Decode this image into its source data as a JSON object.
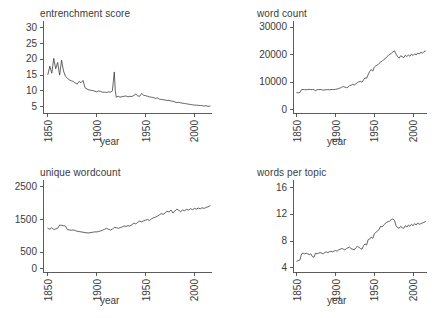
{
  "figure": {
    "background": "#ffffff",
    "ink": "#3c3c3c",
    "layout": "2x2 grid of line charts"
  },
  "chart_data": [
    {
      "id": "entrenchment-score",
      "type": "line",
      "title": "entrenchment score",
      "xlabel": "year",
      "ylabel": "",
      "xlim": [
        1845,
        2018
      ],
      "ylim": [
        3.0,
        31.5
      ],
      "xticks": [
        1850,
        1900,
        1950,
        2000
      ],
      "yticks": [
        5,
        10,
        15,
        20,
        25,
        30
      ],
      "grid": false,
      "legend": "none",
      "x": [
        1850,
        1852,
        1854,
        1856,
        1858,
        1860,
        1862,
        1864,
        1866,
        1868,
        1870,
        1872,
        1874,
        1876,
        1878,
        1880,
        1882,
        1884,
        1886,
        1888,
        1890,
        1892,
        1894,
        1896,
        1898,
        1900,
        1902,
        1904,
        1906,
        1908,
        1910,
        1912,
        1914,
        1916,
        1917,
        1918,
        1919,
        1920,
        1922,
        1924,
        1926,
        1928,
        1930,
        1932,
        1934,
        1936,
        1938,
        1940,
        1942,
        1944,
        1946,
        1948,
        1950,
        1952,
        1954,
        1956,
        1958,
        1960,
        1962,
        1964,
        1966,
        1968,
        1970,
        1972,
        1974,
        1976,
        1978,
        1980,
        1982,
        1984,
        1986,
        1988,
        1990,
        1992,
        1994,
        1996,
        1998,
        2000,
        2002,
        2004,
        2006,
        2008,
        2010,
        2012,
        2014,
        2016
      ],
      "values": [
        15.2,
        17.8,
        15.6,
        20.3,
        17.0,
        19.0,
        15.0,
        19.7,
        16.3,
        14.6,
        14.0,
        13.5,
        13.2,
        13.0,
        12.5,
        12.2,
        13.0,
        12.6,
        13.3,
        11.0,
        10.6,
        10.3,
        10.2,
        10.1,
        9.9,
        9.7,
        10.0,
        9.8,
        9.6,
        9.6,
        9.5,
        9.7,
        9.6,
        10.0,
        13.0,
        16.0,
        10.0,
        8.0,
        8.3,
        8.0,
        8.2,
        8.3,
        8.4,
        8.1,
        8.3,
        8.2,
        8.6,
        9.0,
        8.4,
        8.3,
        9.2,
        8.6,
        8.5,
        8.3,
        8.1,
        8.0,
        7.9,
        7.6,
        7.8,
        7.4,
        7.3,
        7.2,
        7.1,
        7.0,
        7.0,
        6.8,
        6.7,
        6.5,
        6.3,
        6.4,
        6.2,
        6.1,
        6.0,
        5.9,
        5.8,
        5.7,
        5.6,
        5.5,
        5.5,
        5.4,
        5.4,
        5.3,
        5.2,
        5.3,
        5.1,
        5.2
      ]
    },
    {
      "id": "word-count",
      "type": "line",
      "title": "word count",
      "xlabel": "year",
      "ylabel": "",
      "xlim": [
        1845,
        2018
      ],
      "ylim": [
        -1200,
        31500
      ],
      "xticks": [
        1850,
        1900,
        1950,
        2000
      ],
      "yticks": [
        0,
        10000,
        20000,
        30000
      ],
      "grid": false,
      "legend": "none",
      "x": [
        1850,
        1852,
        1854,
        1856,
        1858,
        1860,
        1862,
        1864,
        1866,
        1868,
        1870,
        1872,
        1874,
        1876,
        1878,
        1880,
        1882,
        1884,
        1886,
        1888,
        1890,
        1892,
        1894,
        1896,
        1898,
        1900,
        1902,
        1904,
        1906,
        1908,
        1910,
        1912,
        1914,
        1916,
        1918,
        1920,
        1922,
        1924,
        1926,
        1928,
        1930,
        1932,
        1934,
        1936,
        1938,
        1940,
        1942,
        1944,
        1946,
        1948,
        1950,
        1952,
        1954,
        1956,
        1958,
        1960,
        1962,
        1964,
        1966,
        1968,
        1970,
        1972,
        1974,
        1976,
        1978,
        1980,
        1982,
        1984,
        1986,
        1988,
        1990,
        1992,
        1994,
        1996,
        1998,
        2000,
        2002,
        2004,
        2006,
        2008,
        2010,
        2012,
        2014,
        2016
      ],
      "values": [
        6200,
        6100,
        6300,
        7300,
        7350,
        7300,
        7250,
        7300,
        7400,
        7300,
        7350,
        7300,
        6900,
        7250,
        7300,
        7350,
        7300,
        7100,
        7200,
        7250,
        7300,
        7250,
        7300,
        7350,
        7300,
        7400,
        7500,
        7700,
        7900,
        8200,
        8400,
        8200,
        8000,
        8200,
        8700,
        8900,
        9200,
        9000,
        9300,
        9900,
        10100,
        10300,
        10000,
        10800,
        11600,
        11400,
        12700,
        13900,
        14600,
        14000,
        15500,
        16000,
        16200,
        16800,
        17300,
        17600,
        18200,
        18500,
        19200,
        19700,
        20100,
        20500,
        21000,
        21400,
        20200,
        19300,
        18700,
        19600,
        19300,
        18900,
        19800,
        19300,
        19900,
        19400,
        20200,
        19700,
        20300,
        19900,
        20600,
        20200,
        20900,
        20500,
        21100,
        21300
      ]
    },
    {
      "id": "unique-wordcount",
      "type": "line",
      "title": "unique wordcount",
      "xlabel": "year",
      "ylabel": "",
      "xlim": [
        1845,
        2018
      ],
      "ylim": [
        -110,
        2650
      ],
      "xticks": [
        1850,
        1900,
        1950,
        2000
      ],
      "yticks": [
        0,
        500,
        1500,
        2500
      ],
      "grid": false,
      "legend": "none",
      "x": [
        1850,
        1852,
        1854,
        1856,
        1858,
        1860,
        1862,
        1864,
        1866,
        1868,
        1870,
        1872,
        1874,
        1876,
        1878,
        1880,
        1882,
        1884,
        1886,
        1888,
        1890,
        1892,
        1894,
        1896,
        1898,
        1900,
        1902,
        1904,
        1906,
        1908,
        1910,
        1912,
        1914,
        1916,
        1918,
        1920,
        1922,
        1924,
        1926,
        1928,
        1930,
        1932,
        1934,
        1936,
        1938,
        1940,
        1942,
        1944,
        1946,
        1948,
        1950,
        1952,
        1954,
        1956,
        1958,
        1960,
        1962,
        1964,
        1966,
        1968,
        1970,
        1972,
        1974,
        1976,
        1978,
        1980,
        1982,
        1984,
        1986,
        1988,
        1990,
        1992,
        1994,
        1996,
        1998,
        2000,
        2002,
        2004,
        2006,
        2008,
        2010,
        2012,
        2014,
        2016
      ],
      "values": [
        1230,
        1200,
        1250,
        1190,
        1210,
        1230,
        1330,
        1320,
        1310,
        1300,
        1190,
        1180,
        1170,
        1180,
        1160,
        1140,
        1130,
        1120,
        1110,
        1100,
        1090,
        1090,
        1100,
        1110,
        1120,
        1120,
        1130,
        1150,
        1170,
        1200,
        1230,
        1200,
        1180,
        1200,
        1260,
        1250,
        1230,
        1250,
        1270,
        1300,
        1290,
        1310,
        1300,
        1340,
        1390,
        1360,
        1420,
        1450,
        1430,
        1460,
        1480,
        1500,
        1470,
        1520,
        1550,
        1570,
        1600,
        1640,
        1680,
        1660,
        1700,
        1750,
        1730,
        1790,
        1700,
        1760,
        1820,
        1780,
        1740,
        1790,
        1770,
        1810,
        1790,
        1830,
        1800,
        1840,
        1820,
        1850,
        1830,
        1860,
        1840,
        1870,
        1890,
        1920
      ]
    },
    {
      "id": "words-per-topic",
      "type": "line",
      "title": "words per topic",
      "xlabel": "year",
      "ylabel": "",
      "xlim": [
        1845,
        2018
      ],
      "ylim": [
        3.4,
        16.8
      ],
      "xticks": [
        1850,
        1900,
        1950,
        2000
      ],
      "yticks": [
        4,
        8,
        12,
        16
      ],
      "grid": false,
      "legend": "none",
      "x": [
        1850,
        1852,
        1854,
        1856,
        1858,
        1860,
        1862,
        1864,
        1866,
        1868,
        1870,
        1872,
        1874,
        1876,
        1878,
        1880,
        1882,
        1884,
        1886,
        1888,
        1890,
        1892,
        1894,
        1896,
        1898,
        1900,
        1902,
        1904,
        1906,
        1908,
        1910,
        1912,
        1914,
        1916,
        1918,
        1920,
        1922,
        1924,
        1926,
        1928,
        1930,
        1932,
        1934,
        1936,
        1938,
        1940,
        1942,
        1944,
        1946,
        1948,
        1950,
        1952,
        1954,
        1956,
        1958,
        1960,
        1962,
        1964,
        1966,
        1968,
        1970,
        1972,
        1974,
        1976,
        1978,
        1980,
        1982,
        1984,
        1986,
        1988,
        1990,
        1992,
        1994,
        1996,
        1998,
        2000,
        2002,
        2004,
        2006,
        2008,
        2010,
        2012,
        2014,
        2016
      ],
      "values": [
        5.0,
        5.1,
        5.2,
        6.1,
        6.2,
        6.1,
        6.2,
        6.1,
        6.0,
        6.1,
        5.7,
        5.6,
        6.2,
        6.1,
        6.2,
        6.3,
        6.2,
        6.1,
        6.3,
        6.4,
        6.3,
        6.4,
        6.5,
        6.4,
        6.5,
        6.6,
        6.5,
        6.7,
        6.8,
        6.9,
        6.8,
        6.7,
        6.9,
        7.0,
        7.1,
        6.9,
        6.8,
        6.7,
        7.0,
        7.2,
        7.1,
        6.9,
        6.8,
        7.3,
        7.6,
        7.4,
        8.2,
        8.3,
        8.6,
        8.4,
        9.1,
        9.3,
        9.5,
        9.7,
        10.2,
        10.1,
        10.4,
        10.6,
        10.8,
        10.9,
        11.0,
        11.2,
        11.3,
        11.1,
        10.3,
        10.0,
        9.9,
        10.2,
        10.0,
        9.9,
        10.3,
        10.1,
        10.4,
        10.2,
        10.5,
        10.3,
        10.6,
        10.4,
        10.7,
        10.5,
        10.6,
        10.7,
        10.8,
        10.9
      ]
    }
  ]
}
